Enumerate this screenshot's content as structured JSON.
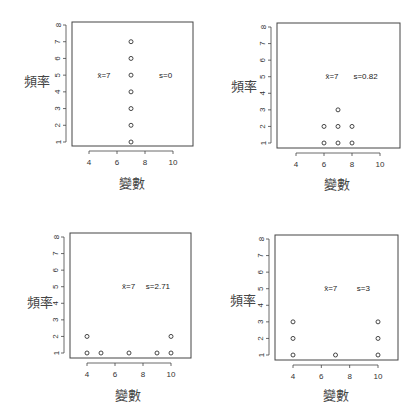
{
  "chart_data": [
    {
      "type": "scatter",
      "panel": "top-left",
      "title": "",
      "xlabel": "變數",
      "ylabel": "頻率",
      "xlim": [
        3,
        11.5
      ],
      "ylim": [
        0.8,
        8.2
      ],
      "xticks": [
        4,
        6,
        8,
        10
      ],
      "yticks": [
        1,
        2,
        3,
        4,
        5,
        6,
        7,
        8
      ],
      "grid": false,
      "points": [
        {
          "x": 7,
          "y": 1
        },
        {
          "x": 7,
          "y": 2
        },
        {
          "x": 7,
          "y": 3
        },
        {
          "x": 7,
          "y": 4
        },
        {
          "x": 7,
          "y": 5
        },
        {
          "x": 7,
          "y": 6
        },
        {
          "x": 7,
          "y": 7
        }
      ],
      "annotations": [
        {
          "text": "x̄=7",
          "x": 4.6,
          "y": 5
        },
        {
          "text": "s=0",
          "x": 9.0,
          "y": 5
        }
      ]
    },
    {
      "type": "scatter",
      "panel": "top-right",
      "title": "",
      "xlabel": "變數",
      "ylabel": "頻率",
      "xlim": [
        3,
        11.5
      ],
      "ylim": [
        0.8,
        8.2
      ],
      "xticks": [
        4,
        6,
        8,
        10
      ],
      "yticks": [
        1,
        2,
        3,
        4,
        5,
        6,
        7,
        8
      ],
      "grid": false,
      "points": [
        {
          "x": 6,
          "y": 1
        },
        {
          "x": 6,
          "y": 2
        },
        {
          "x": 7,
          "y": 1
        },
        {
          "x": 7,
          "y": 2
        },
        {
          "x": 7,
          "y": 3
        },
        {
          "x": 8,
          "y": 1
        },
        {
          "x": 8,
          "y": 2
        }
      ],
      "annotations": [
        {
          "text": "x̄=7",
          "x": 6.1,
          "y": 5
        },
        {
          "text": "s=0.82",
          "x": 8.1,
          "y": 5
        }
      ]
    },
    {
      "type": "scatter",
      "panel": "bottom-left",
      "title": "",
      "xlabel": "變數",
      "ylabel": "頻率",
      "xlim": [
        3,
        11.5
      ],
      "ylim": [
        0.8,
        8.2
      ],
      "xticks": [
        4,
        6,
        8,
        10
      ],
      "yticks": [
        1,
        2,
        3,
        4,
        5,
        6,
        7,
        8
      ],
      "grid": false,
      "points": [
        {
          "x": 4,
          "y": 1
        },
        {
          "x": 4,
          "y": 2
        },
        {
          "x": 5,
          "y": 1
        },
        {
          "x": 7,
          "y": 1
        },
        {
          "x": 9,
          "y": 1
        },
        {
          "x": 10,
          "y": 1
        },
        {
          "x": 10,
          "y": 2
        }
      ],
      "annotations": [
        {
          "text": "x̄=7",
          "x": 6.5,
          "y": 5
        },
        {
          "text": "s=2.71",
          "x": 8.2,
          "y": 5
        }
      ]
    },
    {
      "type": "scatter",
      "panel": "bottom-right",
      "title": "",
      "xlabel": "變數",
      "ylabel": "頻率",
      "xlim": [
        3,
        11.5
      ],
      "ylim": [
        0.8,
        8.2
      ],
      "xticks": [
        4,
        6,
        8,
        10
      ],
      "yticks": [
        1,
        2,
        3,
        4,
        5,
        6,
        7,
        8
      ],
      "grid": false,
      "points": [
        {
          "x": 4,
          "y": 1
        },
        {
          "x": 4,
          "y": 2
        },
        {
          "x": 4,
          "y": 3
        },
        {
          "x": 7,
          "y": 1
        },
        {
          "x": 10,
          "y": 1
        },
        {
          "x": 10,
          "y": 2
        },
        {
          "x": 10,
          "y": 3
        }
      ],
      "annotations": [
        {
          "text": "x̄=7",
          "x": 6.2,
          "y": 5
        },
        {
          "text": "s=3",
          "x": 8.5,
          "y": 5
        }
      ]
    }
  ],
  "layout": {
    "panels": [
      {
        "box": [
          72,
          22,
          193,
          146
        ],
        "x4": 89,
        "x10": 173,
        "y1": 142,
        "y8": 25,
        "ylabel_pos": [
          24,
          81
        ],
        "xlabel_pos": [
          132,
          183
        ]
      },
      {
        "box": [
          277,
          23,
          400,
          148
        ],
        "x4": 296,
        "x10": 380,
        "y1": 143,
        "y8": 27,
        "ylabel_pos": [
          231,
          86
        ],
        "xlabel_pos": [
          337,
          184
        ]
      },
      {
        "box": [
          70,
          233,
          191,
          358
        ],
        "x4": 87,
        "x10": 171,
        "y1": 353,
        "y8": 237,
        "ylabel_pos": [
          27,
          302
        ],
        "xlabel_pos": [
          128,
          395
        ]
      },
      {
        "box": [
          275,
          235,
          398,
          360
        ],
        "x4": 293,
        "x10": 378,
        "y1": 355,
        "y8": 239,
        "ylabel_pos": [
          230,
          300
        ],
        "xlabel_pos": [
          336,
          395
        ]
      }
    ],
    "colors": {
      "axis": "#444444",
      "point": "#333333",
      "text": "#222222"
    }
  }
}
